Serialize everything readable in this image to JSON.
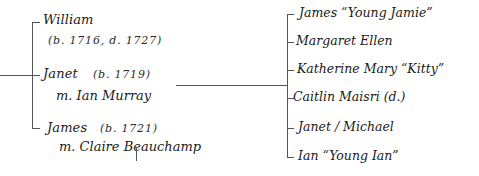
{
  "diagram": {
    "type": "family-tree",
    "line_color": "#555555",
    "text_color": "#1a1a1a",
    "siblings": [
      {
        "name": "William",
        "dates": "(b. 1716, d. 1727)"
      },
      {
        "name": "Janet",
        "dates": "(b. 1719)",
        "spouse": "m. Ian Murray"
      },
      {
        "name": "James",
        "dates": "(b. 1721)",
        "spouse": "m. Claire Beauchamp"
      }
    ],
    "children_of_janet": [
      {
        "label": "James “Young Jamie”"
      },
      {
        "label": "Margaret Ellen"
      },
      {
        "label": "Katherine Mary “Kitty”"
      },
      {
        "label": "Caitlin Maisri (d.)"
      },
      {
        "label": "Janet / Michael"
      },
      {
        "label": "Ian “Young Ian”"
      }
    ]
  }
}
